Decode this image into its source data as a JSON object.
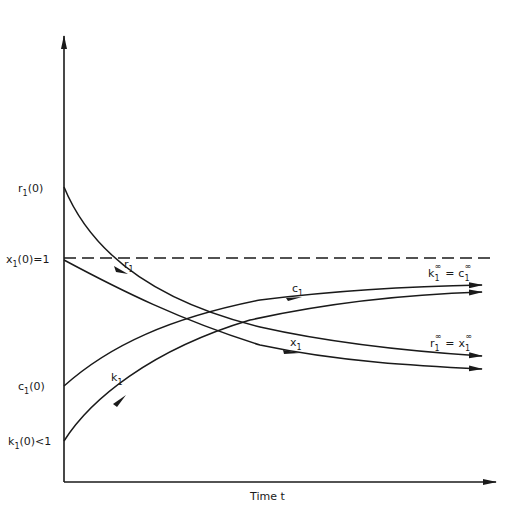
{
  "diagram": {
    "axes": {
      "x_label": "Time t",
      "y_ticks": [
        {
          "id": "r1_0",
          "var": "r",
          "sub": "1",
          "rest": "(0)",
          "y": 187
        },
        {
          "id": "x1_0",
          "var": "x",
          "sub": "1",
          "rest": "(0)=1",
          "y": 258
        },
        {
          "id": "c1_0",
          "var": "c",
          "sub": "1",
          "rest": "(0)",
          "y": 386
        },
        {
          "id": "k1_0",
          "var": "k",
          "sub": "1",
          "rest": "(0)<1",
          "y": 441
        }
      ]
    },
    "reference_line": {
      "label": "x1(0)=1",
      "style": "dashed",
      "y": 258
    },
    "curves": [
      {
        "name": "r1",
        "label_var": "r",
        "label_sub": "1",
        "start": "r1(0)",
        "direction": "decreasing",
        "limit": "r1∞"
      },
      {
        "name": "x1",
        "label_var": "x",
        "label_sub": "1",
        "start": "x1(0)=1",
        "direction": "decreasing",
        "limit": "x1∞"
      },
      {
        "name": "c1",
        "label_var": "c",
        "label_sub": "1",
        "start": "c1(0)",
        "direction": "increasing",
        "limit": "c1∞"
      },
      {
        "name": "k1",
        "label_var": "k",
        "label_sub": "1",
        "start": "k1(0)<1",
        "direction": "increasing",
        "limit": "k1∞"
      }
    ],
    "limit_labels": {
      "upper": {
        "left_var": "k",
        "left_sub": "1",
        "sup": "∞",
        "eq": "=",
        "right_var": "c",
        "right_sub": "1"
      },
      "lower": {
        "left_var": "r",
        "left_sub": "1",
        "sup": "∞",
        "eq": "=",
        "right_var": "x",
        "right_sub": "1"
      }
    },
    "colors": {
      "ink": "#1a1a1a",
      "background": "#ffffff"
    }
  }
}
